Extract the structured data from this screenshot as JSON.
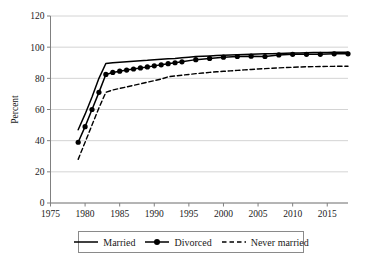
{
  "chart_data": {
    "type": "line",
    "title": "",
    "xlabel": "",
    "ylabel": "Percent",
    "xlim": [
      1975,
      2018
    ],
    "ylim": [
      0,
      120
    ],
    "grid": true,
    "grid_axis": "y",
    "legend_position": "bottom",
    "xticks": [
      1975,
      1980,
      1985,
      1990,
      1995,
      2000,
      2005,
      2010,
      2015
    ],
    "yticks": [
      0,
      20,
      40,
      60,
      80,
      100,
      120
    ],
    "series": [
      {
        "name": "Married",
        "style": "solid",
        "marker": "none",
        "color": "#000000",
        "x": [
          1979,
          1980,
          1981,
          1982,
          1983,
          1984,
          1985,
          1986,
          1987,
          1988,
          1989,
          1990,
          1991,
          1992,
          1993,
          1994,
          1995,
          1996,
          1997,
          1998,
          1999,
          2000,
          2001,
          2002,
          2003,
          2004,
          2005,
          2006,
          2007,
          2008,
          2009,
          2010,
          2011,
          2012,
          2013,
          2014,
          2015,
          2016,
          2017,
          2018
        ],
        "values": [
          47,
          57,
          68,
          80,
          89.5,
          90,
          90.3,
          90.6,
          91,
          91.3,
          91.6,
          92,
          92.3,
          92.6,
          92.8,
          93.2,
          93.6,
          94,
          94.2,
          94.4,
          94.6,
          94.8,
          95,
          95.2,
          95.3,
          95.5,
          95.6,
          95.7,
          95.8,
          96,
          96.1,
          96.2,
          96.3,
          96.4,
          96.5,
          96.6,
          96.6,
          96.7,
          96.7,
          96.8
        ]
      },
      {
        "name": "Divorced",
        "style": "solid",
        "marker": "circle",
        "color": "#000000",
        "x": [
          1979,
          1980,
          1981,
          1982,
          1983,
          1984,
          1985,
          1986,
          1987,
          1988,
          1989,
          1990,
          1991,
          1992,
          1993,
          1994,
          1996,
          1998,
          2000,
          2002,
          2004,
          2006,
          2008,
          2010,
          2012,
          2014,
          2016,
          2018
        ],
        "values": [
          39,
          49,
          60,
          71,
          82.5,
          83.8,
          84.6,
          85.3,
          86,
          86.7,
          87.3,
          88,
          88.7,
          89.4,
          90,
          90.6,
          92,
          92.8,
          93.6,
          94,
          94.2,
          94,
          95,
          95.4,
          95.4,
          95.4,
          95.7,
          95.7
        ]
      },
      {
        "name": "Never married",
        "style": "dashed",
        "marker": "none",
        "color": "#000000",
        "x": [
          1979,
          1980,
          1981,
          1982,
          1983,
          1984,
          1985,
          1986,
          1987,
          1988,
          1989,
          1990,
          1991,
          1992,
          1993,
          1994,
          1995,
          1996,
          1997,
          1998,
          1999,
          2000,
          2001,
          2002,
          2003,
          2004,
          2005,
          2006,
          2007,
          2008,
          2009,
          2010,
          2011,
          2012,
          2013,
          2014,
          2015,
          2016,
          2017,
          2018
        ],
        "values": [
          28,
          39,
          50,
          61,
          71,
          72.5,
          73.5,
          74.5,
          75.5,
          76.5,
          77.5,
          78.5,
          79.5,
          81,
          81.5,
          82,
          82.5,
          83,
          83.4,
          83.8,
          84.2,
          84.5,
          84.8,
          85.1,
          85.4,
          85.7,
          86,
          86.2,
          86.5,
          86.7,
          86.9,
          87.1,
          87.3,
          87.4,
          87.5,
          87.6,
          87.7,
          87.7,
          87.8,
          87.8
        ]
      }
    ],
    "legend": [
      {
        "label": "Married",
        "style": "solid",
        "marker": "none"
      },
      {
        "label": "Divorced",
        "style": "solid",
        "marker": "circle"
      },
      {
        "label": "Never married",
        "style": "dashed",
        "marker": "none"
      }
    ]
  },
  "colors": {
    "line": "#000000",
    "grid": "#d4d4d4",
    "axis": "#808080",
    "text": "#1a1a1a",
    "legend_border": "#8a8a8a"
  }
}
